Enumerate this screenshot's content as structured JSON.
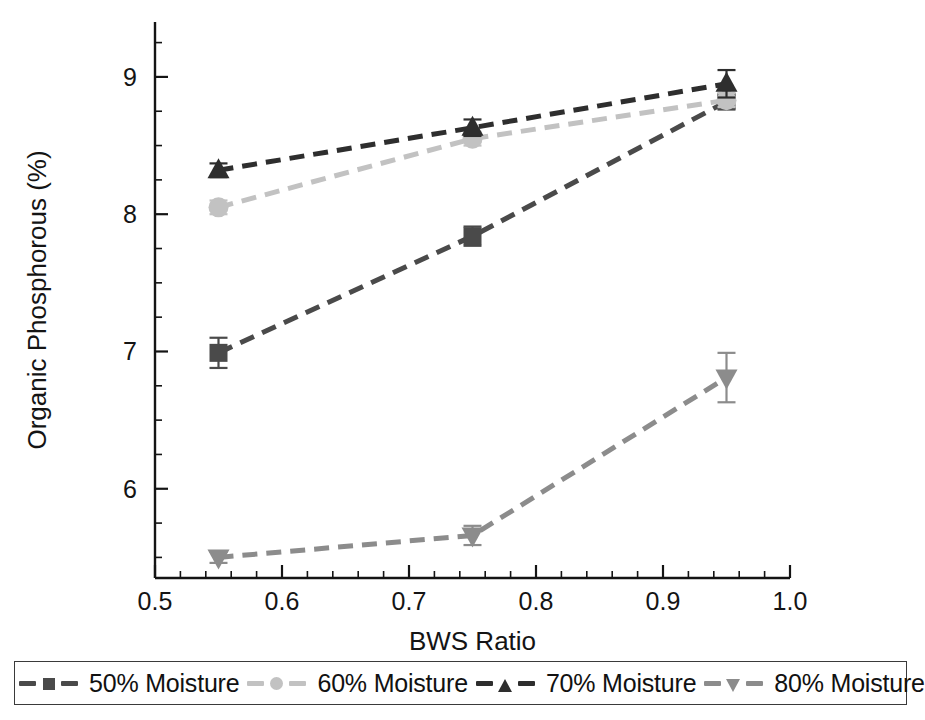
{
  "chart_data": {
    "type": "line",
    "title": "",
    "xlabel": "BWS Ratio",
    "ylabel": "Organic Phosphorous (%)",
    "xlim": [
      0.5,
      1.0
    ],
    "ylim": [
      5.35,
      9.4
    ],
    "x": [
      0.55,
      0.75,
      0.95
    ],
    "xticks": [
      "0.5",
      "0.6",
      "0.7",
      "0.8",
      "0.9",
      "1.0"
    ],
    "xtick_values": [
      0.5,
      0.6,
      0.7,
      0.8,
      0.9,
      1.0
    ],
    "x_minor_step": 0.02,
    "yticks": [
      "6",
      "7",
      "8",
      "9"
    ],
    "ytick_values": [
      6,
      7,
      8,
      9
    ],
    "y_minor_step": 0.25,
    "grid": false,
    "legend_position": "bottom",
    "linestyle": "dashed",
    "series": [
      {
        "name": "50% Moisture",
        "marker": "square",
        "color": "#4a4a4a",
        "values": [
          6.99,
          7.84,
          8.82
        ],
        "errors": [
          0.11,
          0.07,
          0.05
        ]
      },
      {
        "name": "60% Moisture",
        "marker": "circle",
        "color": "#c2c2c2",
        "values": [
          8.05,
          8.55,
          8.83
        ],
        "errors": [
          0.05,
          0.05,
          0.05
        ]
      },
      {
        "name": "70% Moisture",
        "marker": "triangle-up",
        "color": "#2e2e2e",
        "values": [
          8.32,
          8.63,
          8.95
        ],
        "errors": [
          0.05,
          0.06,
          0.1
        ]
      },
      {
        "name": "80% Moisture",
        "marker": "triangle-down",
        "color": "#8c8c8c",
        "values": [
          5.5,
          5.66,
          6.81
        ],
        "errors": [
          0.04,
          0.07,
          0.18
        ]
      }
    ]
  },
  "legend": {
    "entries": [
      {
        "label": "50% Moisture",
        "marker": "square-marker-icon",
        "color": "#4a4a4a"
      },
      {
        "label": "60% Moisture",
        "marker": "circle-marker-icon",
        "color": "#c2c2c2"
      },
      {
        "label": "70% Moisture",
        "marker": "triangle-up-marker-icon",
        "color": "#2e2e2e"
      },
      {
        "label": "80% Moisture",
        "marker": "triangle-down-marker-icon",
        "color": "#8c8c8c"
      }
    ]
  },
  "colors": {
    "axis": "#141414",
    "background": "#ffffff",
    "legend_border": "#3a3a3a"
  }
}
